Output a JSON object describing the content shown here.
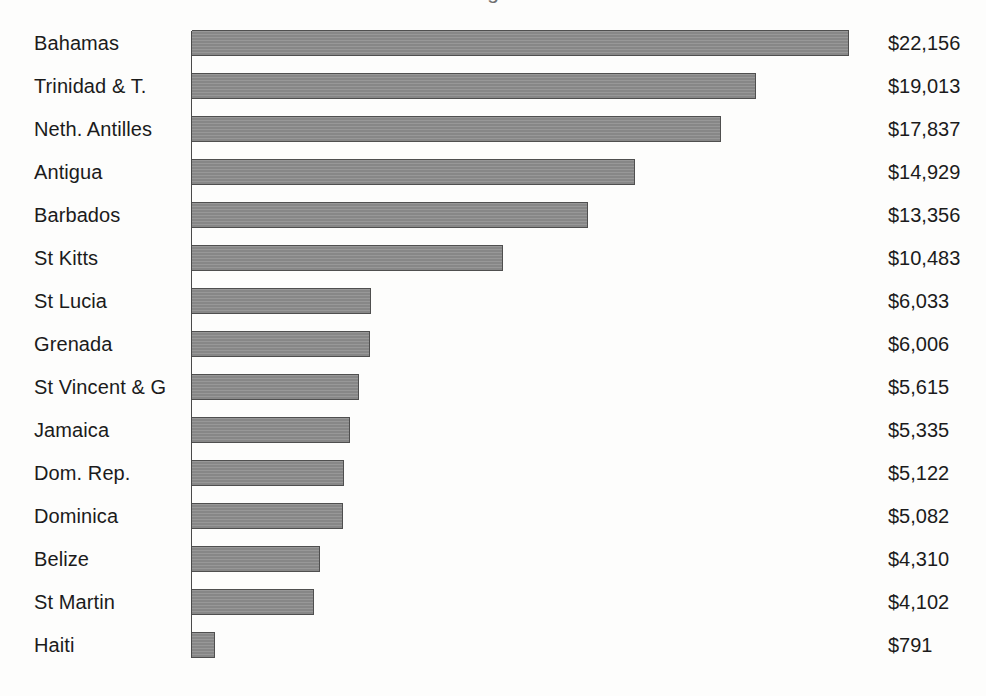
{
  "figure": {
    "clipped_title_fragment": "g",
    "bar_color": "#8c8c8c",
    "bar_border_color": "#4f4f4f",
    "axis_color": "#4a4a4a",
    "background_color": "#fdfdfc",
    "text_color": "#1b1b1b"
  },
  "chart_data": {
    "type": "bar",
    "orientation": "horizontal",
    "title": "",
    "xlabel": "",
    "ylabel": "",
    "categories": [
      "Bahamas",
      "Trinidad & T.",
      "Neth. Antilles",
      "Antigua",
      "Barbados",
      "St Kitts",
      "St Lucia",
      "Grenada",
      "St Vincent & G",
      "Jamaica",
      "Dom. Rep.",
      "Dominica",
      "Belize",
      "St Martin",
      "Haiti"
    ],
    "values": [
      22156,
      19013,
      17837,
      14929,
      13356,
      10483,
      6033,
      6006,
      5615,
      5335,
      5122,
      5082,
      4310,
      4102,
      791
    ],
    "value_labels": [
      "$22,156",
      "$19,013",
      "$17,837",
      "$14,929",
      "$13,356",
      "$10,483",
      "$6,033",
      "$6,006",
      "$5,615",
      "$5,335",
      "$5,122",
      "$5,082",
      "$4,310",
      "$4,102",
      "$791"
    ],
    "xlim": [
      0,
      22156
    ],
    "grid": false,
    "legend": null,
    "axis_ticks": [],
    "sorted": "descending"
  }
}
